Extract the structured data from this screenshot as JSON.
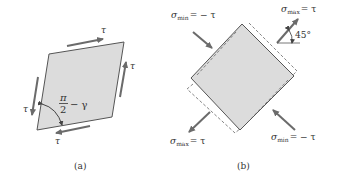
{
  "colors": {
    "fill": "#dcdcdc",
    "edge": "#555555",
    "arrow": "#6b6b6b",
    "text": "#333333",
    "background": "#ffffff"
  },
  "panel_a": {
    "caption": "(a)",
    "shear_labels": {
      "top": "τ",
      "right": "τ",
      "left": "τ",
      "bottom": "τ"
    },
    "angle_label": {
      "numerator": "π",
      "denominator": "2",
      "suffix": "− γ"
    }
  },
  "panel_b": {
    "caption": "(b)",
    "labels": {
      "top_left": {
        "symbol": "σ",
        "sub": "min",
        "rhs": "= − τ"
      },
      "top_right": {
        "symbol": "σ",
        "sub": "max",
        "rhs": "= τ"
      },
      "bottom_left": {
        "symbol": "σ",
        "sub": "max",
        "rhs": "= τ"
      },
      "bottom_right": {
        "symbol": "σ",
        "sub": "min",
        "rhs": "= − τ"
      }
    },
    "angle": "45°"
  }
}
